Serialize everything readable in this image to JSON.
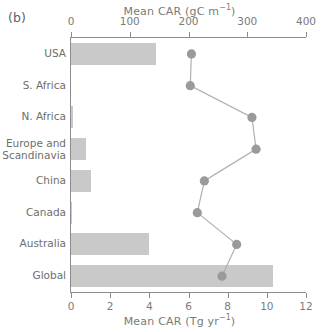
{
  "panel": {
    "label": "(b)"
  },
  "axes": {
    "top": {
      "title_main": "Mean CAR (gC m",
      "title_sup": "−1",
      "title_tail": ")",
      "title_full": "Mean CAR (gC m−1)",
      "ticks": [
        "0",
        "100",
        "200",
        "300",
        "400"
      ]
    },
    "bottom": {
      "title_main": "Mean CAR (Tg yr",
      "title_sup": "−1",
      "title_tail": ")",
      "title_full": "Mean CAR (Tg yr−1)",
      "ticks": [
        "0",
        "2",
        "4",
        "6",
        "8",
        "10",
        "12"
      ]
    }
  },
  "colors": {
    "bar_fill": "#c9c9c9",
    "marker_fill": "#9a9a9a",
    "line": "#b0b0b0",
    "axis": "#8c8c8c",
    "text": "#6e6e6e"
  },
  "chart_data": {
    "type": "bar",
    "title": "",
    "categories": [
      "USA",
      "S. Africa",
      "N. Africa",
      "Europe and\nScandinavia",
      "China",
      "Canada",
      "Australia",
      "Global"
    ],
    "series": [
      {
        "name": "Mean CAR (Tg yr−1)",
        "render": "bar",
        "axis": "bottom",
        "values": [
          4.35,
          0.0,
          0.08,
          0.75,
          1.0,
          0.05,
          4.0,
          10.3
        ]
      },
      {
        "name": "Mean CAR (gC m−1)",
        "render": "line-marker",
        "axis": "top",
        "values": [
          205,
          203,
          308,
          315,
          227,
          215,
          282,
          257
        ]
      }
    ],
    "xlim_bottom": [
      0,
      12
    ],
    "xlim_top": [
      0,
      400
    ],
    "xlabel_bottom": "Mean CAR (Tg yr−1)",
    "xlabel_top": "Mean CAR (gC m−1)",
    "ylabel": "",
    "grid": false,
    "legend": "none",
    "orientation": "horizontal"
  }
}
